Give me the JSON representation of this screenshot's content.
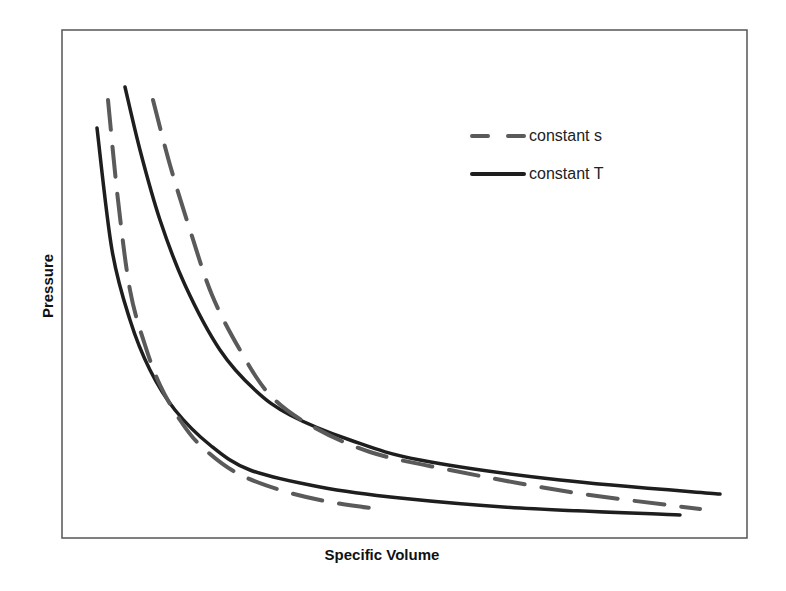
{
  "chart_data": {
    "type": "line",
    "title": "",
    "xlabel": "Specific Volume",
    "ylabel": "Pressure",
    "grid": false,
    "axis_ticks": false,
    "legend_position": "upper-right (inside plot)",
    "legend": [
      {
        "label": "constant s",
        "style": "dashed",
        "color": "#5a5a5a"
      },
      {
        "label": "constant T",
        "style": "solid",
        "color": "#1e1e1e"
      }
    ],
    "plot_frame_px": {
      "left": 62,
      "top": 30,
      "right": 747,
      "bottom": 538
    },
    "series": [
      {
        "name": "constant T (lower isotherm)",
        "style": "solid",
        "color": "#1e1e1e",
        "points_px": [
          [
            97,
            128
          ],
          [
            112,
            250
          ],
          [
            130,
            320
          ],
          [
            150,
            370
          ],
          [
            175,
            410
          ],
          [
            210,
            445
          ],
          [
            250,
            470
          ],
          [
            320,
            487
          ],
          [
            400,
            498
          ],
          [
            520,
            508
          ],
          [
            680,
            515
          ]
        ]
      },
      {
        "name": "constant T (upper isotherm)",
        "style": "solid",
        "color": "#1e1e1e",
        "points_px": [
          [
            125,
            87
          ],
          [
            140,
            150
          ],
          [
            160,
            220
          ],
          [
            185,
            285
          ],
          [
            220,
            350
          ],
          [
            255,
            390
          ],
          [
            290,
            415
          ],
          [
            350,
            440
          ],
          [
            420,
            460
          ],
          [
            560,
            480
          ],
          [
            720,
            494
          ]
        ]
      },
      {
        "name": "constant s (lower isentrope)",
        "style": "dashed",
        "color": "#5a5a5a",
        "points_px": [
          [
            108,
            100
          ],
          [
            118,
            200
          ],
          [
            130,
            290
          ],
          [
            145,
            345
          ],
          [
            160,
            385
          ],
          [
            180,
            420
          ],
          [
            200,
            445
          ],
          [
            235,
            472
          ],
          [
            280,
            490
          ],
          [
            330,
            502
          ],
          [
            385,
            510
          ]
        ]
      },
      {
        "name": "constant s (upper isentrope)",
        "style": "dashed",
        "color": "#5a5a5a",
        "points_px": [
          [
            153,
            100
          ],
          [
            170,
            165
          ],
          [
            190,
            230
          ],
          [
            212,
            295
          ],
          [
            240,
            350
          ],
          [
            270,
            395
          ],
          [
            310,
            425
          ],
          [
            370,
            452
          ],
          [
            450,
            470
          ],
          [
            570,
            492
          ],
          [
            700,
            509
          ]
        ]
      }
    ]
  },
  "labels": {
    "xlabel": "Specific Volume",
    "ylabel": "Pressure",
    "legend_s": "constant s",
    "legend_T": "constant T"
  }
}
